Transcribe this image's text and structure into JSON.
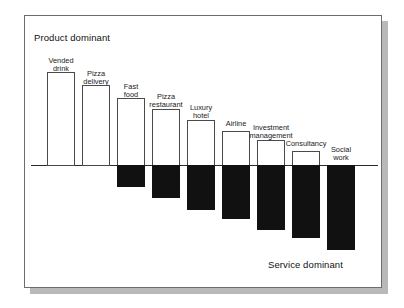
{
  "figure": {
    "top_left_caption": "Product dominant",
    "bottom_right_caption": "Service dominant",
    "background_color": "#ffffff",
    "border_color": "#6d6d6d",
    "shadow_color": "#b9b9b9",
    "axis_color": "#2b2b2b"
  },
  "chart_data": {
    "type": "bar",
    "title": "",
    "subtitle": "",
    "xlabel": "",
    "ylabel": "",
    "orientation": "vertical",
    "grid": false,
    "legend": false,
    "legend_position": "none",
    "axis_baseline_value": 0,
    "ylim": [
      -100,
      100
    ],
    "value_units": "percent of offering",
    "annotations": [
      {
        "text": "Product dominant",
        "position": "top-left"
      },
      {
        "text": "Service dominant",
        "position": "bottom-right"
      }
    ],
    "series": [
      {
        "name": "Product (tangible) component",
        "color": "#ffffff",
        "edge_color": "#4a4a4a"
      },
      {
        "name": "Service (intangible) component",
        "color": "#111111",
        "edge_color": "#111111"
      }
    ],
    "categories": [
      "Vended drink",
      "Pizza delivery",
      "Fast food",
      "Pizza restaurant",
      "Luxury hotel",
      "Airline",
      "Investment management",
      "Consultancy",
      "Social work"
    ],
    "product_values": [
      98,
      90,
      80,
      70,
      60,
      48,
      38,
      22,
      0
    ],
    "service_values": [
      0,
      0,
      -26,
      -38,
      -52,
      -63,
      -75,
      -85,
      -98
    ],
    "bars": [
      {
        "category": "Vended drink",
        "label_lines": "Vended\ndrink",
        "product_value": 98,
        "service_value": 0,
        "label_top_px": 57,
        "product_top_px": 72,
        "product_height_px": 94,
        "service_height_px": 0,
        "left_px": 47
      },
      {
        "category": "Pizza delivery",
        "label_lines": "Pizza\ndelivery",
        "product_value": 90,
        "service_value": 0,
        "label_top_px": 70,
        "product_top_px": 85,
        "product_height_px": 81,
        "service_height_px": 0,
        "left_px": 82
      },
      {
        "category": "Fast food",
        "label_lines": "Fast\nfood",
        "product_value": 80,
        "service_value": -26,
        "label_top_px": 83,
        "product_top_px": 98,
        "product_height_px": 68,
        "service_height_px": 22,
        "left_px": 117
      },
      {
        "category": "Pizza restaurant",
        "label_lines": "Pizza\nrestaurant",
        "product_value": 70,
        "service_value": -38,
        "label_top_px": 93,
        "product_top_px": 109,
        "product_height_px": 57,
        "service_height_px": 33,
        "left_px": 152
      },
      {
        "category": "Luxury hotel",
        "label_lines": "Luxury\nhotel",
        "product_value": 60,
        "service_value": -52,
        "label_top_px": 104,
        "product_top_px": 120,
        "product_height_px": 46,
        "service_height_px": 45,
        "left_px": 187
      },
      {
        "category": "Airline",
        "label_lines": "Airline",
        "product_value": 48,
        "service_value": -63,
        "label_top_px": 120,
        "product_top_px": 131,
        "product_height_px": 35,
        "service_height_px": 54,
        "left_px": 222
      },
      {
        "category": "Investment management",
        "label_lines": "Investment\nmanagement",
        "product_value": 38,
        "service_value": -75,
        "label_top_px": 124,
        "product_top_px": 140,
        "product_height_px": 26,
        "service_height_px": 65,
        "left_px": 257
      },
      {
        "category": "Consultancy",
        "label_lines": "Consultancy",
        "product_value": 22,
        "service_value": -85,
        "label_top_px": 140,
        "product_top_px": 151,
        "product_height_px": 15,
        "service_height_px": 73,
        "left_px": 292
      },
      {
        "category": "Social work",
        "label_lines": "Social\nwork",
        "product_value": 0,
        "service_value": -98,
        "label_top_px": 146,
        "product_top_px": 165,
        "product_height_px": 0,
        "service_height_px": 85,
        "left_px": 327
      }
    ]
  }
}
